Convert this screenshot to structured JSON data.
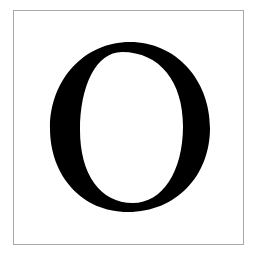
{
  "card": {
    "letter": "O",
    "border_color": "#a8a8a8",
    "background_color": "#ffffff",
    "glyph_color": "#000000"
  }
}
